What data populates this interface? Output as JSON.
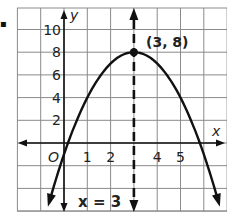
{
  "bullet": "▪",
  "chart_data": {
    "type": "line",
    "title": "",
    "function": "y = -(x - 3)^2 + 8",
    "xlabel": "x",
    "ylabel": "y",
    "origin_label": "O",
    "x_tick_labels": [
      "1",
      "2",
      "4",
      "5"
    ],
    "y_tick_labels": [
      "2",
      "4",
      "6",
      "8",
      "10"
    ],
    "xlim": [
      -2,
      7
    ],
    "ylim": [
      -6,
      12
    ],
    "grid": true,
    "x_grid_step": 1,
    "y_grid_step": 2,
    "series": [
      {
        "name": "parabola",
        "x": [
          -0.6,
          0,
          0.17,
          1,
          2,
          3,
          4,
          5,
          5.83,
          6,
          6.6
        ],
        "y": [
          -4.96,
          -1,
          0,
          4,
          7,
          8,
          7,
          4,
          0,
          -1,
          -4.96
        ]
      }
    ],
    "vertex": {
      "x": 3,
      "y": 8,
      "label": "(3, 8)"
    },
    "axis_of_symmetry": {
      "x": 3,
      "label": "x = 3",
      "style": "dashed"
    }
  },
  "colors": {
    "curve": "#111111",
    "grid": "#8a8a8a",
    "axis": "#111111"
  }
}
